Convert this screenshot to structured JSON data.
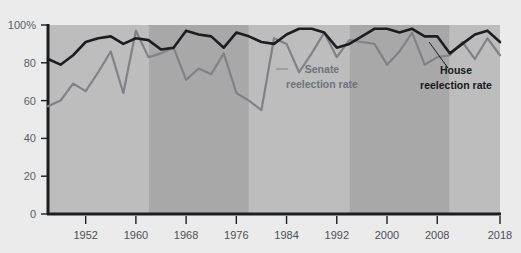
{
  "chart_data": {
    "type": "line",
    "title": "",
    "subtitle": "",
    "xlabel": "",
    "ylabel": "",
    "xlim": [
      1946,
      2018
    ],
    "ylim": [
      0,
      100
    ],
    "grid": false,
    "legend_position": "inline-annotations",
    "y_ticks": [
      0,
      20,
      40,
      60,
      80,
      100
    ],
    "y_tick_labels": [
      "0",
      "20",
      "40",
      "60",
      "80",
      "100%"
    ],
    "x_ticks": [
      1952,
      1960,
      1968,
      1976,
      1984,
      1992,
      2000,
      2008,
      2018
    ],
    "x_tick_labels": [
      "1952",
      "1960",
      "1968",
      "1976",
      "1984",
      "1992",
      "2000",
      "2008",
      "2018"
    ],
    "x": [
      1946,
      1948,
      1950,
      1952,
      1954,
      1956,
      1958,
      1960,
      1962,
      1964,
      1966,
      1968,
      1970,
      1972,
      1974,
      1976,
      1978,
      1980,
      1982,
      1984,
      1986,
      1988,
      1990,
      1992,
      1994,
      1996,
      1998,
      2000,
      2002,
      2004,
      2006,
      2008,
      2010,
      2012,
      2014,
      2016,
      2018
    ],
    "series": [
      {
        "name": "House reelection rate",
        "color": "#1b1d21",
        "values": [
          82,
          79,
          84,
          91,
          93,
          94,
          90,
          93,
          92,
          87,
          88,
          97,
          95,
          94,
          88,
          96,
          94,
          91,
          90,
          95,
          98,
          98,
          96,
          88,
          90,
          94,
          98,
          98,
          96,
          98,
          94,
          94,
          85,
          90,
          95,
          97,
          91
        ]
      },
      {
        "name": "Senate reelection rate",
        "color": "#818187",
        "values": [
          57,
          60,
          69,
          65,
          75,
          86,
          64,
          97,
          83,
          85,
          88,
          71,
          77,
          74,
          85,
          64,
          60,
          55,
          93,
          90,
          75,
          85,
          96,
          83,
          92,
          91,
          90,
          79,
          86,
          96,
          79,
          83,
          84,
          91,
          82,
          93,
          84
        ]
      }
    ],
    "annotations": [
      {
        "label_line1": "Senate",
        "label_line2": "reelection rate",
        "series": "Senate reelection rate"
      },
      {
        "label_line1": "House",
        "label_line2": "reelection rate",
        "series": "House reelection rate"
      }
    ],
    "background_bands": {
      "light_color": "#bdbdbd",
      "dark_color": "#a8a8a8",
      "period_years": 16
    },
    "axis_color": "#1b1d21",
    "page_background": "#ebebeb"
  }
}
